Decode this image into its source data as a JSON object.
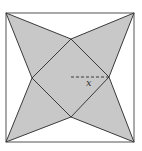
{
  "figure": {
    "type": "geometry-diagram",
    "colors": {
      "background": "#ffffff",
      "shade": "#c8c8c8",
      "stroke": "#3a3a3a",
      "outer_stroke": "#555555"
    },
    "outer_square": {
      "x1": 6,
      "y1": 13,
      "x2": 134,
      "y2": 142
    },
    "inner_diamond": {
      "top": [
        71,
        39
      ],
      "right": [
        109,
        77
      ],
      "bottom": [
        71,
        117
      ],
      "left": [
        32,
        78
      ]
    },
    "star_polygon": "6,13 71,39 134,13 109,77 134,142 71,117 6,142 32,78",
    "dashed_segment": {
      "x1": 71,
      "y1": 77,
      "x2": 109,
      "y2": 77
    },
    "labels": {
      "x_label": "x"
    }
  }
}
